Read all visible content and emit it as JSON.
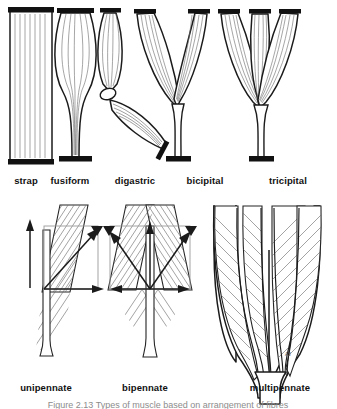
{
  "figure": {
    "signature": "AJ",
    "caption": "Figure 2.13  Types of muscle based on arrangement of fibres",
    "colors": {
      "ink": "#1b1b1b",
      "fibre": "#6f6f6f",
      "tendon_bar": "#111111",
      "hatch": "#6a6a6a",
      "vector": "#1b1b1b",
      "box_guide": "#9a9a9a",
      "background": "#ffffff"
    }
  },
  "rows": [
    {
      "name": "parallel-and-convergent-row",
      "items": [
        {
          "id": "strap",
          "label": "strap",
          "label_x": 26,
          "label_y": 184
        },
        {
          "id": "fusiform",
          "label": "fusiform",
          "label_x": 70,
          "label_y": 184
        },
        {
          "id": "digastric",
          "label": "digastric",
          "label_x": 135,
          "label_y": 184
        },
        {
          "id": "bicipital",
          "label": "bicipital",
          "label_x": 205,
          "label_y": 184
        },
        {
          "id": "tricipital",
          "label": "tricipital",
          "label_x": 288,
          "label_y": 184
        }
      ]
    },
    {
      "name": "pennate-row",
      "items": [
        {
          "id": "unipennate",
          "label": "unipennate",
          "label_x": 46,
          "label_y": 391
        },
        {
          "id": "bipennate",
          "label": "bipennate",
          "label_x": 145,
          "label_y": 391
        },
        {
          "id": "multipennate",
          "label": "multipennate",
          "label_x": 280,
          "label_y": 391
        }
      ]
    }
  ]
}
